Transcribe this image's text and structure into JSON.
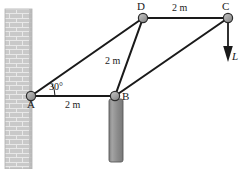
{
  "figure": {
    "type": "statics-truss-free-body-diagram",
    "width": 241,
    "height": 169,
    "background": "#ffffff",
    "stroke_color": "#1a1a1a",
    "joint_fill": "#9a9a9a",
    "wall_fill": "#c9c9c9",
    "post_fill": "#8c8c8c"
  },
  "joints": [
    {
      "id": "A",
      "label": "A",
      "x": 31,
      "y": 96,
      "label_x": 27,
      "label_y": 99
    },
    {
      "id": "B",
      "label": "B",
      "x": 115,
      "y": 96,
      "label_x": 122,
      "label_y": 92
    },
    {
      "id": "C",
      "label": "C",
      "x": 228,
      "y": 18,
      "label_x": 224,
      "label_y": 2
    },
    {
      "id": "D",
      "label": "D",
      "x": 143,
      "y": 18,
      "label_x": 139,
      "label_y": 2
    }
  ],
  "members": [
    {
      "name": "member-AB",
      "from": "A",
      "to": "B"
    },
    {
      "name": "member-AD",
      "from": "A",
      "to": "D"
    },
    {
      "name": "member-BD",
      "from": "B",
      "to": "D"
    },
    {
      "name": "member-BC",
      "from": "B",
      "to": "C"
    },
    {
      "name": "member-DC",
      "from": "D",
      "to": "C"
    }
  ],
  "dimensions": [
    {
      "name": "dimension-AB",
      "text": "2 m",
      "x": 66,
      "y": 100
    },
    {
      "name": "dimension-BD",
      "text": "2 m",
      "x": 106,
      "y": 57
    },
    {
      "name": "dimension-DC",
      "text": "2 m",
      "x": 174,
      "y": 3
    }
  ],
  "angle": {
    "name": "angle-at-A",
    "text": "30°",
    "value_degrees": 30,
    "x": 49,
    "y": 83,
    "vertex": "A",
    "from_member": "member-AB",
    "to_member": "member-AD"
  },
  "load": {
    "name": "load-L",
    "label": "L",
    "applied_at": "C",
    "direction": "down",
    "arrow_from_y": 18,
    "arrow_to_y": 60,
    "label_x": 232,
    "label_y": 57
  },
  "wall": {
    "name": "support-wall",
    "x": 5,
    "y": 9,
    "width": 27,
    "height": 160,
    "pattern": "brick"
  },
  "post": {
    "name": "support-post",
    "x": 109,
    "y": 99,
    "width": 14,
    "height": 63
  }
}
